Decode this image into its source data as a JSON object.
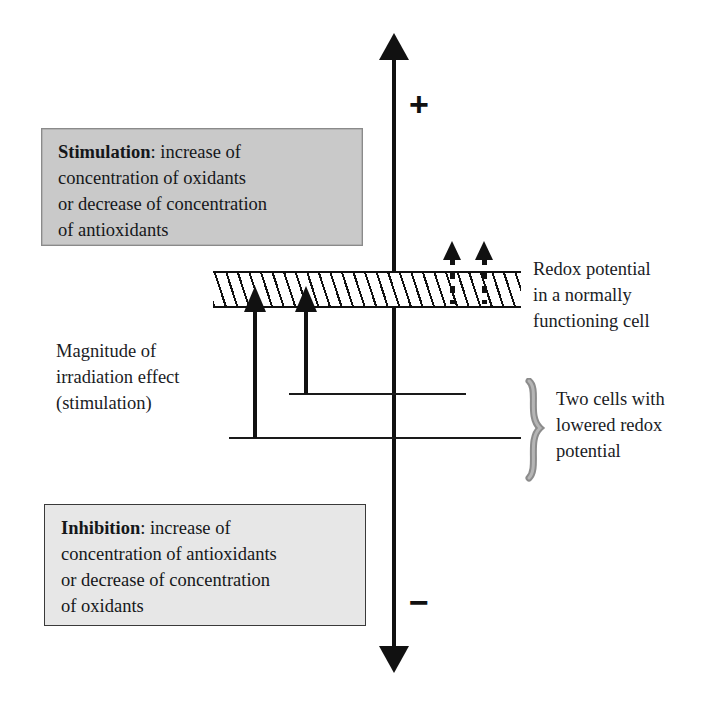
{
  "diagram": {
    "axis": {
      "name": "redox-potential-axis",
      "plus_sign": "+",
      "minus_sign": "−"
    },
    "boxes": {
      "stimulation": {
        "keyword": "Stimulation",
        "separator": ": ",
        "body": "increase of\nconcentration of oxidants\nor decrease of concentration\nof antioxidants",
        "fill_color": "#c9c9c9",
        "border_color": "#8a8a8a"
      },
      "inhibition": {
        "keyword": "Inhibition",
        "separator": ": ",
        "body": "increase of\nconcentration of antioxidants\nor decrease of concentration\nof oxidants",
        "fill_color": "#e7e7e7",
        "border_color": "#3a3a3a"
      }
    },
    "labels": {
      "magnitude": "Magnitude of\nirradiation effect\n(stimulation)",
      "redox_band": "Redox potential\nin a normally\nfunctioning cell",
      "two_cells": "Two cells with\nlowered redox\npotential"
    },
    "band": {
      "name": "redox-potential-band",
      "style": "diagonal-hatch",
      "line_color": "#111111"
    },
    "arrows": {
      "solid": [
        {
          "name": "stimulation-arrow-1",
          "from_level": "lower",
          "direction": "up"
        },
        {
          "name": "stimulation-arrow-2",
          "from_level": "upper",
          "direction": "up"
        }
      ],
      "dashed": [
        {
          "name": "inhibition-arrow-1",
          "direction": "up"
        },
        {
          "name": "inhibition-arrow-2",
          "direction": "up"
        }
      ]
    },
    "levels": [
      {
        "name": "cell-level-upper"
      },
      {
        "name": "cell-level-lower"
      }
    ],
    "colors": {
      "ink": "#111111",
      "text": "#1a1c1f",
      "background": "#ffffff"
    }
  }
}
